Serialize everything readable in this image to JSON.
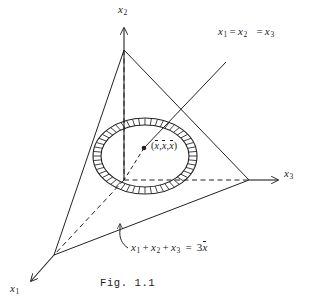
{
  "figure": {
    "caption": "Fig. 1.1",
    "background_color": "#ffffff",
    "ink_color": "#222222"
  },
  "axes": [
    {
      "id": "x1",
      "base": "x",
      "sub": "1",
      "direction": "down-left",
      "arrow": true
    },
    {
      "id": "x2",
      "base": "x",
      "sub": "2",
      "direction": "up",
      "arrow": true
    },
    {
      "id": "x3",
      "base": "x",
      "sub": "3",
      "direction": "right",
      "arrow": true
    }
  ],
  "labels": {
    "axis_x1": {
      "base": "x",
      "sub": "1"
    },
    "axis_x2": {
      "base": "x",
      "sub": "2"
    },
    "axis_x3": {
      "base": "x",
      "sub": "3"
    },
    "diagonal_line": {
      "text": "x1 = x2 = x3",
      "parts": [
        "x",
        "1",
        "=",
        "x",
        "2",
        "=",
        "x",
        "3"
      ]
    },
    "centroid_point": {
      "text": "(x̄,x̄,x̄)",
      "open": "(",
      "var": "x",
      "comma": ",",
      "close": ")"
    },
    "plane_equation": {
      "text": "x1 + x2 + x3 = 3x̄",
      "coefficient": "3",
      "var": "x"
    }
  },
  "geometry": {
    "triangle_vertices": [
      {
        "name": "x2-intercept",
        "x": 124,
        "y": 50
      },
      {
        "name": "x1-intercept",
        "x": 54,
        "y": 255
      },
      {
        "name": "x3-intercept",
        "x": 249,
        "y": 180
      }
    ],
    "origin": {
      "x": 124,
      "y": 180
    },
    "centroid": {
      "x": 144,
      "y": 148
    },
    "annulus": {
      "center_x": 145,
      "center_y": 156,
      "outer_rx": 52,
      "outer_ry": 38,
      "inner_rx": 44,
      "inner_ry": 31,
      "hatch_segments": 52,
      "style": "radial-hatched-ring"
    }
  }
}
